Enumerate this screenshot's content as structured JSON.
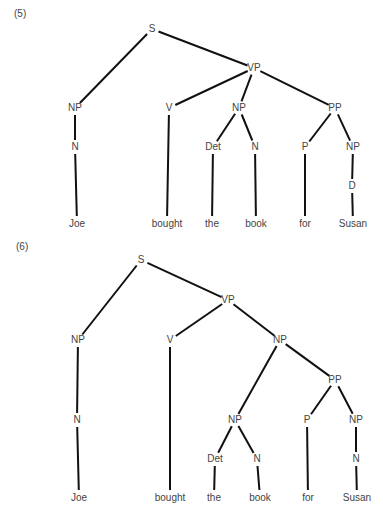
{
  "diagrams": [
    {
      "number": "(5)",
      "number_pos": [
        14,
        14
      ],
      "nodes": [
        {
          "id": "S",
          "label": "S",
          "x": 152,
          "y": 29
        },
        {
          "id": "NP1",
          "label": "NP",
          "x": 75,
          "y": 108
        },
        {
          "id": "VP",
          "label": "VP",
          "x": 254,
          "y": 68
        },
        {
          "id": "N1",
          "label": "N",
          "x": 75,
          "y": 147
        },
        {
          "id": "Joe",
          "label": "Joe",
          "x": 77,
          "y": 224
        },
        {
          "id": "V",
          "label": "V",
          "x": 169,
          "y": 108
        },
        {
          "id": "bought",
          "label": "bought",
          "x": 167,
          "y": 224
        },
        {
          "id": "NP2",
          "label": "NP",
          "x": 239,
          "y": 108
        },
        {
          "id": "Det",
          "label": "Det",
          "x": 213,
          "y": 147
        },
        {
          "id": "the",
          "label": "the",
          "x": 212,
          "y": 224
        },
        {
          "id": "N2",
          "label": "N",
          "x": 255,
          "y": 147
        },
        {
          "id": "book",
          "label": "book",
          "x": 256,
          "y": 224
        },
        {
          "id": "PP",
          "label": "PP",
          "x": 335,
          "y": 108
        },
        {
          "id": "P",
          "label": "P",
          "x": 305,
          "y": 147
        },
        {
          "id": "for",
          "label": "for",
          "x": 305,
          "y": 224
        },
        {
          "id": "NP3",
          "label": "NP",
          "x": 353,
          "y": 147
        },
        {
          "id": "D",
          "label": "D",
          "x": 352,
          "y": 186
        },
        {
          "id": "Susan",
          "label": "Susan",
          "x": 353,
          "y": 224
        }
      ],
      "edges": [
        [
          "S",
          "NP1"
        ],
        [
          "S",
          "VP"
        ],
        [
          "NP1",
          "N1"
        ],
        [
          "N1",
          "Joe"
        ],
        [
          "VP",
          "V"
        ],
        [
          "V",
          "bought"
        ],
        [
          "VP",
          "NP2"
        ],
        [
          "VP",
          "PP"
        ],
        [
          "NP2",
          "Det"
        ],
        [
          "NP2",
          "N2"
        ],
        [
          "Det",
          "the"
        ],
        [
          "N2",
          "book"
        ],
        [
          "PP",
          "P"
        ],
        [
          "PP",
          "NP3"
        ],
        [
          "P",
          "for"
        ],
        [
          "NP3",
          "D"
        ],
        [
          "D",
          "Susan"
        ]
      ]
    },
    {
      "number": "(6)",
      "number_pos": [
        16,
        247
      ],
      "nodes": [
        {
          "id": "S",
          "label": "S",
          "x": 141,
          "y": 260
        },
        {
          "id": "NP1",
          "label": "NP",
          "x": 78,
          "y": 340
        },
        {
          "id": "VP",
          "label": "VP",
          "x": 228,
          "y": 300
        },
        {
          "id": "N1",
          "label": "N",
          "x": 77,
          "y": 420
        },
        {
          "id": "Joe",
          "label": "Joe",
          "x": 79,
          "y": 498
        },
        {
          "id": "V",
          "label": "V",
          "x": 170,
          "y": 340
        },
        {
          "id": "bought",
          "label": "bought",
          "x": 170,
          "y": 498
        },
        {
          "id": "NP2",
          "label": "NP",
          "x": 280,
          "y": 340
        },
        {
          "id": "PP",
          "label": "PP",
          "x": 335,
          "y": 380
        },
        {
          "id": "NP3",
          "label": "NP",
          "x": 235,
          "y": 420
        },
        {
          "id": "Det",
          "label": "Det",
          "x": 215,
          "y": 459
        },
        {
          "id": "the",
          "label": "the",
          "x": 214,
          "y": 498
        },
        {
          "id": "N2",
          "label": "N",
          "x": 257,
          "y": 459
        },
        {
          "id": "book",
          "label": "book",
          "x": 260,
          "y": 498
        },
        {
          "id": "P",
          "label": "P",
          "x": 307,
          "y": 420
        },
        {
          "id": "for",
          "label": "for",
          "x": 308,
          "y": 498
        },
        {
          "id": "NP4",
          "label": "NP",
          "x": 356,
          "y": 420
        },
        {
          "id": "N3",
          "label": "N",
          "x": 356,
          "y": 459
        },
        {
          "id": "Susan",
          "label": "Susan",
          "x": 357,
          "y": 498
        }
      ],
      "edges": [
        [
          "S",
          "NP1"
        ],
        [
          "S",
          "VP"
        ],
        [
          "NP1",
          "N1"
        ],
        [
          "N1",
          "Joe"
        ],
        [
          "VP",
          "V"
        ],
        [
          "V",
          "bought"
        ],
        [
          "VP",
          "NP2"
        ],
        [
          "NP2",
          "NP3"
        ],
        [
          "NP2",
          "PP"
        ],
        [
          "NP3",
          "Det"
        ],
        [
          "NP3",
          "N2"
        ],
        [
          "Det",
          "the"
        ],
        [
          "N2",
          "book"
        ],
        [
          "PP",
          "P"
        ],
        [
          "PP",
          "NP4"
        ],
        [
          "P",
          "for"
        ],
        [
          "NP4",
          "N3"
        ],
        [
          "N3",
          "Susan"
        ]
      ]
    }
  ]
}
